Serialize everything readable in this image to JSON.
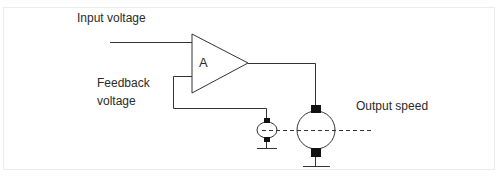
{
  "diagram": {
    "labels": {
      "input": "Input voltage",
      "feedback_line1": "Feedback",
      "feedback_line2": "voltage",
      "output": "Output speed",
      "amplifier": "A"
    },
    "components": [
      {
        "id": "amplifier",
        "type": "triangle-amplifier",
        "label": "A"
      },
      {
        "id": "tachogenerator",
        "type": "ellipse-generator"
      },
      {
        "id": "motor",
        "type": "dc-motor-circle"
      }
    ],
    "connections": [
      {
        "from": "input",
        "to": "amplifier"
      },
      {
        "from": "amplifier",
        "to": "motor"
      },
      {
        "from": "tachogenerator",
        "to": "amplifier",
        "kind": "feedback"
      },
      {
        "from": "tachogenerator",
        "to": "motor",
        "kind": "mechanical-shaft-dashed"
      }
    ],
    "colors": {
      "line": "#333333",
      "terminal": "#111111",
      "text": "#2a2a2a",
      "frame": "#ececec"
    }
  }
}
